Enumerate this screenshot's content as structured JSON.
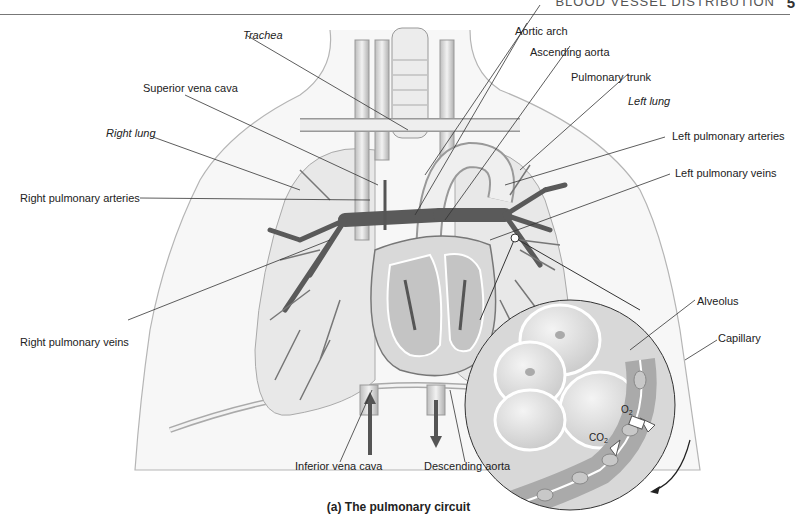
{
  "header": {
    "section_title": "BLOOD VESSEL DISTRIBUTION",
    "page_number": "5"
  },
  "caption": "(a) The pulmonary circuit",
  "labels": {
    "trachea": "Trachea",
    "superior_vena_cava": "Superior vena cava",
    "right_lung": "Right lung",
    "right_pulmonary_arteries": "Right pulmonary arteries",
    "right_pulmonary_veins": "Right pulmonary veins",
    "aortic_arch": "Aortic arch",
    "ascending_aorta": "Ascending aorta",
    "pulmonary_trunk": "Pulmonary trunk",
    "left_lung": "Left lung",
    "left_pulmonary_arteries": "Left pulmonary arteries",
    "left_pulmonary_veins": "Left pulmonary veins",
    "alveolus": "Alveolus",
    "capillary": "Capillary",
    "inferior_vena_cava": "Inferior vena cava",
    "descending_aorta": "Descending aorta",
    "o2": "O",
    "o2_sub": "2",
    "co2": "CO",
    "co2_sub": "2"
  }
}
